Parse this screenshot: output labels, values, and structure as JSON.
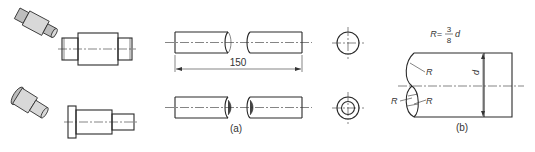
{
  "figure": {
    "isometric_views": [
      {
        "name": "solid-shaft-pictorial",
        "type": "pictorial"
      },
      {
        "name": "stepped-pin-pictorial",
        "type": "pictorial"
      }
    ],
    "panel_a": {
      "caption": "(a)",
      "dimension_label": "150",
      "rows": [
        {
          "name": "solid-round-bar",
          "end_view": "circle"
        },
        {
          "name": "hollow-tube",
          "end_view": "concentric-circles"
        }
      ]
    },
    "panel_b": {
      "caption": "(b)",
      "formula": {
        "lhs": "R=",
        "numerator": "3",
        "denominator": "8",
        "variable": "d"
      },
      "labels": {
        "radius_top": "R",
        "radius_left": "R",
        "radius_right": "R",
        "diameter": "d"
      }
    }
  }
}
